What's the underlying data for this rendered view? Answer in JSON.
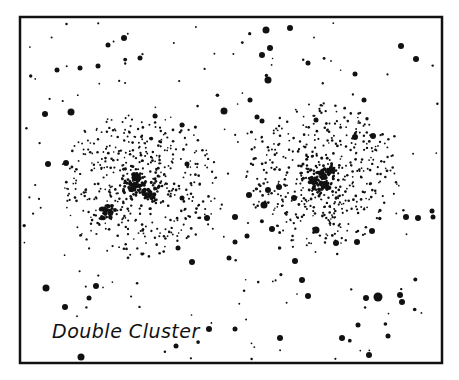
{
  "title": "Double Cluster",
  "colors": {
    "ink": "#111111",
    "paper": "#ffffff"
  },
  "frame": {
    "x": 20,
    "y": 17,
    "width": 422,
    "height": 346,
    "stroke_width": 2.5
  },
  "label": {
    "text": "Double Cluster",
    "x": 52,
    "y": 338
  },
  "clusters": [
    {
      "name": "cluster-west",
      "cx": 138,
      "cy": 185,
      "radius": 80,
      "count": 520,
      "seed": 7,
      "cores": [
        [
          140,
          180,
          6
        ],
        [
          150,
          196,
          4
        ],
        [
          106,
          213,
          5
        ],
        [
          132,
          187,
          3
        ],
        [
          108,
          210,
          4
        ],
        [
          146,
          192,
          3
        ],
        [
          136,
          176,
          3
        ]
      ]
    },
    {
      "name": "cluster-east",
      "cx": 322,
      "cy": 175,
      "radius": 78,
      "count": 480,
      "seed": 13,
      "cores": [
        [
          322,
          175,
          5
        ],
        [
          318,
          185,
          4
        ],
        [
          331,
          170,
          3
        ],
        [
          312,
          180,
          3
        ],
        [
          326,
          186,
          3
        ]
      ]
    }
  ],
  "field": {
    "count": 170,
    "seed": 21
  },
  "bright_stars": [
    [
      124,
      38,
      3
    ],
    [
      290,
      28,
      3
    ],
    [
      266,
      30,
      3.5
    ],
    [
      270,
      48,
      3
    ],
    [
      262,
      55,
      3
    ],
    [
      401,
      46,
      3
    ],
    [
      416,
      59,
      3
    ],
    [
      108,
      45,
      2.5
    ],
    [
      98,
      66,
      2.5
    ],
    [
      140,
      58,
      2.5
    ],
    [
      80,
      68,
      2.5
    ],
    [
      57,
      70,
      2.5
    ],
    [
      308,
      63,
      2.5
    ],
    [
      355,
      74,
      2.5
    ],
    [
      268,
      80,
      3.5
    ],
    [
      250,
      100,
      2.5
    ],
    [
      364,
      100,
      2.5
    ],
    [
      45,
      114,
      3
    ],
    [
      71,
      112,
      3.5
    ],
    [
      224,
      111,
      3.5
    ],
    [
      155,
      116,
      2.5
    ],
    [
      182,
      125,
      2.5
    ],
    [
      66,
      163,
      3
    ],
    [
      48,
      164,
      3
    ],
    [
      257,
      117,
      2.5
    ],
    [
      262,
      121,
      2.5
    ],
    [
      316,
      120,
      2.5
    ],
    [
      355,
      137,
      3
    ],
    [
      373,
      136,
      3
    ],
    [
      249,
      195,
      3
    ],
    [
      235,
      217,
      3
    ],
    [
      264,
      205,
      3.5
    ],
    [
      268,
      190,
      3
    ],
    [
      279,
      187,
      3
    ],
    [
      294,
      198,
      3
    ],
    [
      115,
      210,
      2
    ],
    [
      207,
      218,
      3
    ],
    [
      192,
      262,
      3
    ],
    [
      178,
      248,
      2.5
    ],
    [
      96,
      286,
      3
    ],
    [
      89,
      298,
      2.5
    ],
    [
      46,
      288,
      3.5
    ],
    [
      65,
      307,
      3
    ],
    [
      209,
      329,
      3
    ],
    [
      235,
      329,
      2.5
    ],
    [
      81,
      357,
      3.5
    ],
    [
      176,
      346,
      2.5
    ],
    [
      235,
      242,
      2.5
    ],
    [
      229,
      258,
      2.5
    ],
    [
      272,
      229,
      3
    ],
    [
      295,
      261,
      3
    ],
    [
      316,
      230,
      3.5
    ],
    [
      336,
      243,
      3
    ],
    [
      357,
      242,
      3
    ],
    [
      372,
      231,
      3
    ],
    [
      406,
      217,
      3
    ],
    [
      418,
      218,
      3
    ],
    [
      433,
      217,
      2.5
    ],
    [
      432,
      211,
      2.5
    ],
    [
      302,
      280,
      3
    ],
    [
      308,
      296,
      3
    ],
    [
      378,
      297,
      4.5
    ],
    [
      366,
      298,
      3
    ],
    [
      400,
      295,
      3
    ],
    [
      402,
      302,
      3
    ],
    [
      280,
      338,
      3
    ],
    [
      342,
      338,
      3
    ],
    [
      252,
      378,
      0
    ],
    [
      369,
      355,
      3
    ],
    [
      358,
      325,
      2.5
    ],
    [
      388,
      336,
      2.5
    ],
    [
      247,
      236,
      2.5
    ],
    [
      187,
      164,
      2.5
    ],
    [
      182,
      198,
      2.5
    ]
  ]
}
